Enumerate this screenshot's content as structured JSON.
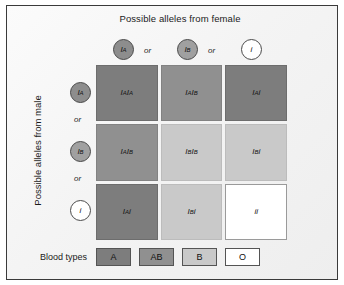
{
  "figure": {
    "top_title": "Possible alleles from female",
    "left_title": "Possible alleles from male",
    "or_1": "or",
    "or_2": "or",
    "or_3": "or",
    "or_4": "or"
  },
  "female_alleles": [
    {
      "base": "I",
      "sup": "A",
      "shade": "dark"
    },
    {
      "base": "I",
      "sup": "B",
      "shade": "medium"
    },
    {
      "base": "i",
      "sup": "",
      "shade": "light"
    }
  ],
  "male_alleles": [
    {
      "base": "I",
      "sup": "A",
      "shade": "dark"
    },
    {
      "base": "I",
      "sup": "B",
      "shade": "medium"
    },
    {
      "base": "i",
      "sup": "",
      "shade": "light"
    }
  ],
  "grid": {
    "cells": [
      {
        "g1": "I",
        "s1": "A",
        "g2": "I",
        "s2": "A",
        "type": "A",
        "blood_type": "A"
      },
      {
        "g1": "I",
        "s1": "A",
        "g2": "I",
        "s2": "B",
        "type": "AB",
        "blood_type": "AB"
      },
      {
        "g1": "I",
        "s1": "A",
        "g2": "i",
        "s2": "",
        "type": "A",
        "blood_type": "A"
      },
      {
        "g1": "I",
        "s1": "A",
        "g2": "I",
        "s2": "B",
        "type": "AB",
        "blood_type": "AB"
      },
      {
        "g1": "I",
        "s1": "B",
        "g2": "I",
        "s2": "B",
        "type": "B",
        "blood_type": "B"
      },
      {
        "g1": "I",
        "s1": "B",
        "g2": "i",
        "s2": "",
        "type": "B",
        "blood_type": "B"
      },
      {
        "g1": "I",
        "s1": "A",
        "g2": "i",
        "s2": "",
        "type": "A",
        "blood_type": "A"
      },
      {
        "g1": "I",
        "s1": "B",
        "g2": "i",
        "s2": "",
        "type": "B",
        "blood_type": "B"
      },
      {
        "g1": "i",
        "s1": "",
        "g2": "i",
        "s2": "",
        "type": "O",
        "blood_type": "O"
      }
    ]
  },
  "legend": {
    "label": "Blood types",
    "items": [
      {
        "label": "A",
        "type": "A"
      },
      {
        "label": "AB",
        "type": "AB"
      },
      {
        "label": "B",
        "type": "B"
      },
      {
        "label": "O",
        "type": "O"
      }
    ]
  },
  "colors": {
    "type_A": "#7d7d7d",
    "type_AB": "#909090",
    "type_B": "#c9c9c9",
    "type_O": "#ffffff",
    "border": "#3a3a3a",
    "background": "#f4f4f4"
  }
}
